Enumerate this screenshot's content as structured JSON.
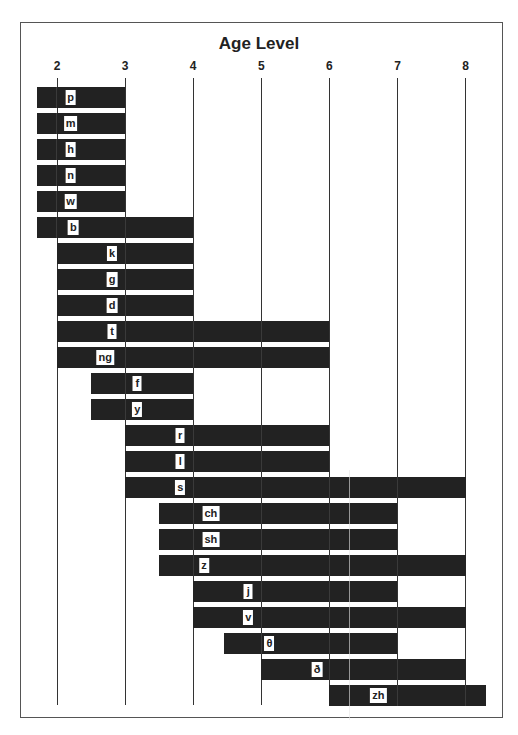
{
  "chart_data": {
    "type": "bar",
    "orientation": "horizontal-range",
    "title": "Age Level",
    "xlabel": "Age Level",
    "ylabel": "",
    "x_ticks": [
      "2",
      "3",
      "4",
      "5",
      "6",
      "7",
      "8"
    ],
    "xlim": [
      1.7,
      8.4
    ],
    "grid": true,
    "legend": null,
    "categories": [
      "p",
      "m",
      "h",
      "n",
      "w",
      "b",
      "k",
      "g",
      "d",
      "t",
      "ng",
      "f",
      "y",
      "r",
      "l",
      "s",
      "ch",
      "sh",
      "z",
      "j",
      "v",
      "θ",
      "ð",
      "zh"
    ],
    "series": [
      {
        "name": "start_age",
        "values": [
          1.7,
          1.7,
          1.7,
          1.7,
          1.7,
          1.7,
          2,
          2,
          2,
          2,
          2,
          2.5,
          2.5,
          3,
          3,
          3,
          3.5,
          3.5,
          3.5,
          4,
          4,
          4.5,
          5,
          6
        ]
      },
      {
        "name": "end_age",
        "values": [
          3,
          3,
          3,
          3,
          3,
          4,
          4,
          4,
          4,
          6,
          6,
          4,
          4,
          6,
          6,
          8,
          7,
          7,
          8,
          7,
          8,
          7,
          8,
          8.3
        ]
      }
    ],
    "bars": [
      {
        "label": "p",
        "start": 1.7,
        "end": 3,
        "label_at": 2.2
      },
      {
        "label": "m",
        "start": 1.7,
        "end": 3,
        "label_at": 2.2
      },
      {
        "label": "h",
        "start": 1.7,
        "end": 3,
        "label_at": 2.2
      },
      {
        "label": "n",
        "start": 1.7,
        "end": 3,
        "label_at": 2.2
      },
      {
        "label": "w",
        "start": 1.7,
        "end": 3,
        "label_at": 2.2
      },
      {
        "label": "b",
        "start": 1.7,
        "end": 4,
        "label_at": 2.24
      },
      {
        "label": "k",
        "start": 2,
        "end": 4,
        "label_at": 2.81
      },
      {
        "label": "g",
        "start": 2,
        "end": 4,
        "label_at": 2.81
      },
      {
        "label": "d",
        "start": 2,
        "end": 4,
        "label_at": 2.81
      },
      {
        "label": "t",
        "start": 2,
        "end": 6,
        "label_at": 2.81
      },
      {
        "label": "ng",
        "start": 2,
        "end": 6,
        "label_at": 2.71
      },
      {
        "label": "f",
        "start": 2.5,
        "end": 4,
        "label_at": 3.18
      },
      {
        "label": "y",
        "start": 2.5,
        "end": 4,
        "label_at": 3.18
      },
      {
        "label": "r",
        "start": 3,
        "end": 6,
        "label_at": 3.81
      },
      {
        "label": "l",
        "start": 3,
        "end": 6,
        "label_at": 3.81
      },
      {
        "label": "s",
        "start": 3,
        "end": 8,
        "label_at": 3.81
      },
      {
        "label": "ch",
        "start": 3.5,
        "end": 7,
        "label_at": 4.26
      },
      {
        "label": "sh",
        "start": 3.5,
        "end": 7,
        "label_at": 4.26
      },
      {
        "label": "z",
        "start": 3.5,
        "end": 8,
        "label_at": 4.16
      },
      {
        "label": "j",
        "start": 4,
        "end": 7,
        "label_at": 4.81
      },
      {
        "label": "v",
        "start": 4,
        "end": 8,
        "label_at": 4.81
      },
      {
        "label": "θ",
        "start": 4.45,
        "end": 7,
        "label_at": 5.12
      },
      {
        "label": "ð",
        "start": 5,
        "end": 8,
        "label_at": 5.82
      },
      {
        "label": "zh",
        "start": 6,
        "end": 8.3,
        "label_at": 6.72
      }
    ]
  },
  "colors": {
    "bar": "#222222",
    "label_bg": "#ffffff",
    "grid": "#333333",
    "frame": "#555555"
  }
}
